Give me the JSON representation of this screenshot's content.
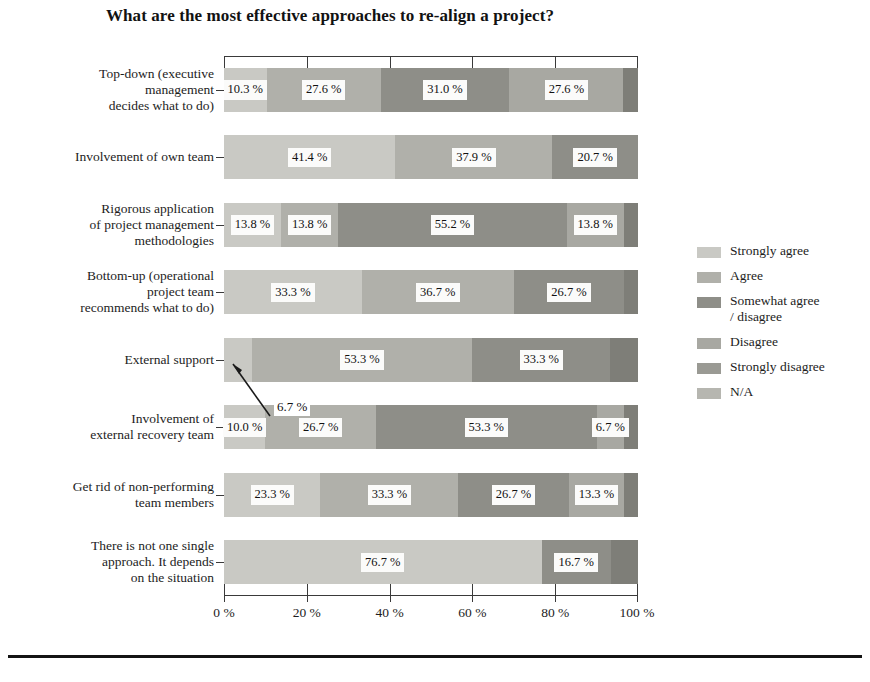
{
  "chart_data": {
    "type": "bar",
    "subtype": "stacked-horizontal-100",
    "title": "What are the most effective approaches to re-align a project?",
    "xlabel": "",
    "ylabel": "",
    "xlim": [
      0,
      100
    ],
    "grid": false,
    "legend_position": "right",
    "xticks": [
      "0 %",
      "20 %",
      "40 %",
      "60 %",
      "80 %",
      "100 %"
    ],
    "xtick_values": [
      0,
      20,
      40,
      60,
      80,
      100
    ],
    "categories": [
      "Top-down (executive management decides what to do)",
      "Involvement of own team",
      "Rigorous application of project management methodologies",
      "Bottom-up (operational project team recommends what to do)",
      "External support",
      "Involvement of external recovery team",
      "Get rid of non-performing team members",
      "There is not one single approach.  It depends on the situation"
    ],
    "category_lines": [
      [
        "Top-down (executive",
        "management",
        "decides what to do)"
      ],
      [
        "Involvement of own team"
      ],
      [
        "Rigorous application",
        "of project management",
        "methodologies"
      ],
      [
        "Bottom-up (operational",
        "project team",
        "recommends what to do)"
      ],
      [
        "External support"
      ],
      [
        "Involvement of",
        "external recovery team"
      ],
      [
        "Get rid of non-performing",
        "team members"
      ],
      [
        "There is not one single",
        "approach.  It depends",
        "on the situation"
      ]
    ],
    "series": [
      {
        "name": "Strongly agree",
        "color": "#c9c9c4",
        "values": [
          10.3,
          41.4,
          13.8,
          33.3,
          6.7,
          10.0,
          23.3,
          76.7
        ]
      },
      {
        "name": "Agree",
        "color": "#b0b0aa",
        "values": [
          27.6,
          37.9,
          13.8,
          36.7,
          53.3,
          26.7,
          33.3,
          0.0
        ]
      },
      {
        "name": "Somewhat agree / disagree",
        "color": "#8e8e88",
        "values": [
          31.0,
          20.7,
          55.2,
          26.7,
          33.3,
          53.3,
          26.7,
          16.7
        ]
      },
      {
        "name": "Disagree",
        "color": "#a8a8a2",
        "values": [
          27.6,
          0.0,
          13.8,
          0.0,
          0.0,
          6.7,
          13.3,
          0.0
        ]
      },
      {
        "name": "Strongly disagree",
        "color": "#9a9a94",
        "values": [
          0.0,
          0.0,
          0.0,
          0.0,
          0.0,
          0.0,
          0.0,
          0.0
        ]
      },
      {
        "name": "N/A",
        "color": "#7e7e78",
        "values": [
          3.5,
          0.0,
          3.4,
          3.3,
          6.7,
          3.3,
          3.4,
          6.6
        ]
      }
    ],
    "bar_labels": [
      [
        "10.3 %",
        "27.6 %",
        "31.0 %",
        "27.6 %",
        "",
        ""
      ],
      [
        "41.4 %",
        "37.9 %",
        "20.7 %",
        "",
        "",
        ""
      ],
      [
        "13.8 %",
        "13.8 %",
        "55.2 %",
        "13.8 %",
        "",
        ""
      ],
      [
        "33.3 %",
        "36.7 %",
        "26.7 %",
        "",
        "",
        ""
      ],
      [
        "",
        "53.3 %",
        "33.3 %",
        "",
        "",
        ""
      ],
      [
        "10.0 %",
        "26.7 %",
        "53.3 %",
        "6.7 %",
        "",
        ""
      ],
      [
        "23.3 %",
        "33.3 %",
        "26.7 %",
        "13.3 %",
        "",
        ""
      ],
      [
        "76.7 %",
        "",
        "16.7 %",
        "",
        "",
        ""
      ]
    ],
    "annotations": [
      {
        "text": "6.7 %",
        "points_to_series": "Strongly agree",
        "points_to_category": "External support"
      }
    ]
  },
  "legend": {
    "items": [
      {
        "label": "Strongly agree",
        "lines": [
          "Strongly agree"
        ],
        "color": "#c9c9c4"
      },
      {
        "label": "Agree",
        "lines": [
          "Agree"
        ],
        "color": "#b0b0aa"
      },
      {
        "label": "Somewhat agree / disagree",
        "lines": [
          "Somewhat agree",
          "/ disagree"
        ],
        "color": "#8e8e88"
      },
      {
        "label": "Disagree",
        "lines": [
          "Disagree"
        ],
        "color": "#a8a8a2"
      },
      {
        "label": "Strongly disagree",
        "lines": [
          "Strongly disagree"
        ],
        "color": "#9a9a94"
      },
      {
        "label": "N/A",
        "lines": [
          "N/A"
        ],
        "color": "#b6b6b0"
      }
    ]
  },
  "colors": {
    "axis": "#3a3a3a",
    "text": "#1d1d1d",
    "label_background": "#fbfbfa",
    "footer_rule": "#141414"
  }
}
